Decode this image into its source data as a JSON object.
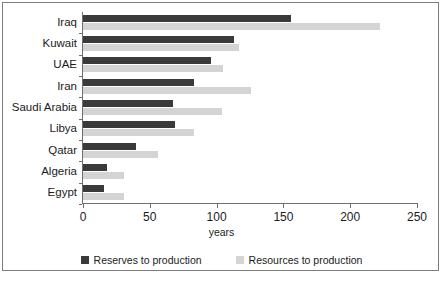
{
  "figure": {
    "axis_title": "years",
    "caption": ""
  },
  "legend": {
    "position": "bottom-center",
    "entries": [
      {
        "label": "Reserves to production",
        "color": "#3a3a3a",
        "swatch": "square-swatch-dark"
      },
      {
        "label": "Resources to production",
        "color": "#d4d4d4",
        "swatch": "square-swatch-light"
      }
    ]
  },
  "colors": {
    "reserves": "#3a3a3a",
    "resources": "#d4d4d4",
    "axis": "#6e6e6e",
    "frame": "#7d7d7d",
    "text": "#1b1b1b"
  },
  "chart_data": {
    "type": "bar",
    "orientation": "horizontal",
    "title": "",
    "subtitle": "",
    "xlabel": "years",
    "ylabel": "",
    "xlim": [
      0,
      250
    ],
    "xticks": [
      0,
      50,
      100,
      150,
      200,
      250
    ],
    "xtick_labels": [
      "0",
      "50",
      "100",
      "150",
      "200",
      "250"
    ],
    "grid": false,
    "legend_position": "bottom-center",
    "categories": [
      "Iraq",
      "Kuwait",
      "UAE",
      "Iran",
      "Saudi Arabia",
      "Libya",
      "Qatar",
      "Algeria",
      "Egypt"
    ],
    "series": [
      {
        "name": "Reserves to production",
        "color": "#3a3a3a",
        "values": [
          156,
          113,
          96,
          83,
          67,
          69,
          40,
          18,
          16
        ]
      },
      {
        "name": "Resources to production",
        "color": "#d4d4d4",
        "values": [
          222,
          117,
          105,
          126,
          104,
          83,
          56,
          31,
          31
        ]
      }
    ]
  }
}
